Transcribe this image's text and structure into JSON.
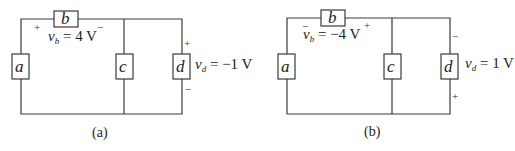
{
  "figure": {
    "circuit_a": {
      "caption": "(a)",
      "elements": {
        "a": "a",
        "b": "b",
        "c": "c",
        "d": "d"
      },
      "vb_label": {
        "var": "v",
        "sub": "b",
        "value": " = 4 V"
      },
      "vb_polarity": {
        "left": "+",
        "right": "−"
      },
      "vd_label": {
        "var": "v",
        "sub": "d",
        "value": " = −1 V"
      },
      "vd_polarity": {
        "top": "+",
        "bottom": "−"
      }
    },
    "circuit_b": {
      "caption": "(b)",
      "elements": {
        "a": "a",
        "b": "b",
        "c": "c",
        "d": "d"
      },
      "vb_label": {
        "var": "v",
        "sub": "b",
        "value": " = −4 V"
      },
      "vb_polarity": {
        "left": "−",
        "right": "+"
      },
      "vd_label": {
        "var": "v",
        "sub": "d",
        "value": " = 1 V"
      },
      "vd_polarity": {
        "top": "−",
        "bottom": "+"
      }
    }
  }
}
